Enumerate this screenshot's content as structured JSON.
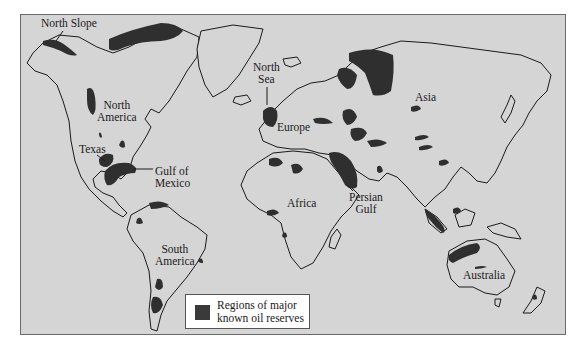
{
  "map": {
    "title": "Regions of major known oil reserves",
    "colors": {
      "background": "#d5d5d5",
      "land_outline": "#1a1a1a",
      "oil_reserve_fill": "#2f2f2f",
      "legend_background": "#ffffff"
    },
    "labels": {
      "north_slope": "North Slope",
      "north_america_1": "North",
      "north_america_2": "America",
      "texas": "Texas",
      "gulf_of_mexico_1": "Gulf of",
      "gulf_of_mexico_2": "Mexico",
      "south_america_1": "South",
      "south_america_2": "America",
      "north_sea_1": "North",
      "north_sea_2": "Sea",
      "europe": "Europe",
      "africa": "Africa",
      "persian_gulf_1": "Persian",
      "persian_gulf_2": "Gulf",
      "asia": "Asia",
      "australia": "Australia"
    },
    "legend": {
      "line1": "Regions of major",
      "line2": "known oil reserves"
    }
  }
}
